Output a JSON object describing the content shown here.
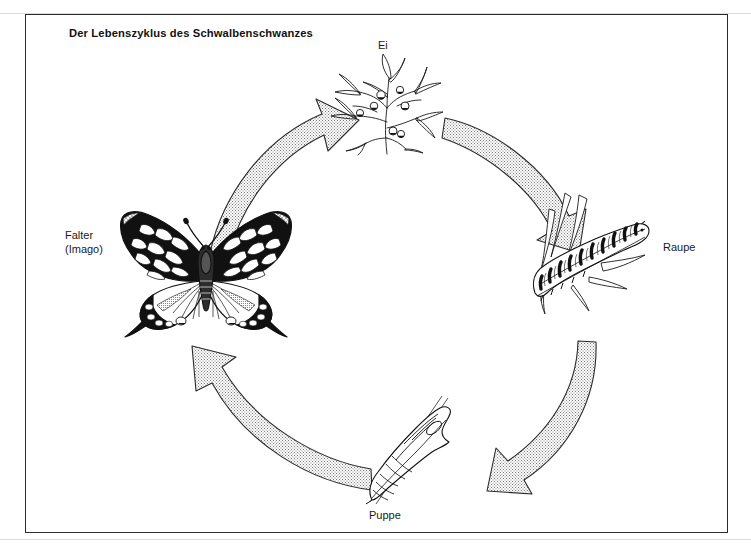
{
  "figure": {
    "title": "Der Lebenszyklus des Schwalbenschwanzes",
    "kind": "life-cycle-diagram",
    "organism": "Schwalbenschwanz (Papilio machaon)",
    "frame": {
      "border_color": "#2b2b2b",
      "background_color": "#ffffff"
    },
    "ink_color": "#111111",
    "arrow_fill_color": "#f2f2f2",
    "arrow_stipple_color": "#6e6e6e"
  },
  "stages": [
    {
      "id": "ei",
      "label": "Ei",
      "order": 1,
      "position": "top"
    },
    {
      "id": "raupe",
      "label": "Raupe",
      "order": 2,
      "position": "right"
    },
    {
      "id": "puppe",
      "label": "Puppe",
      "order": 3,
      "position": "bottom"
    },
    {
      "id": "falter",
      "label_line1": "Falter",
      "label_line2": "(Imago)",
      "order": 4,
      "position": "left"
    }
  ],
  "arrows": [
    {
      "id": "falter-to-ei",
      "from": "falter",
      "to": "ei",
      "direction": "up-right"
    },
    {
      "id": "ei-to-raupe",
      "from": "ei",
      "to": "raupe",
      "direction": "down-right"
    },
    {
      "id": "raupe-to-puppe",
      "from": "raupe",
      "to": "puppe",
      "direction": "down-left"
    },
    {
      "id": "puppe-to-falter",
      "from": "puppe",
      "to": "falter",
      "direction": "up-left"
    }
  ]
}
